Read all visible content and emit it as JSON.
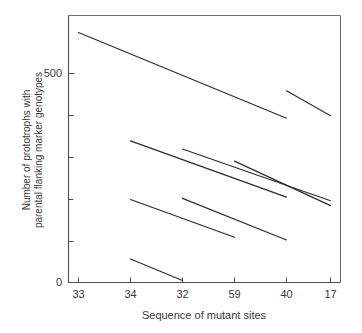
{
  "chart_data": {
    "type": "line",
    "title": "",
    "subtitle": "",
    "xlabel": "Sequence of mutant sites",
    "ylabel": "Number of prototrophs with parental flanking marker genotypes",
    "ylabel_line1": "Number of prototrophs with",
    "ylabel_line2": "parental flanking marker genotypes",
    "categories": [
      "33",
      "34",
      "32",
      "59",
      "40",
      "17"
    ],
    "xtick_labels": [
      "33",
      "34",
      "32",
      "59",
      "40",
      "17"
    ],
    "ytick_labels": [
      "500",
      "0"
    ],
    "ylim": [
      0,
      660
    ],
    "ytick_values": [
      0,
      100,
      200,
      300,
      400,
      500,
      600
    ],
    "ylabeled_ticks": [
      0,
      500
    ],
    "grid": false,
    "legend": false,
    "legend_position": "none",
    "axis_style": "box-frame",
    "series": [
      {
        "name": "segment-1",
        "from_category": "33",
        "to_category": "40",
        "x": [
          1,
          5
        ],
        "values": [
          618,
          406
        ]
      },
      {
        "name": "segment-2",
        "from_category": "40",
        "to_category": "17",
        "x": [
          5,
          6
        ],
        "values": [
          474,
          412
        ]
      },
      {
        "name": "segment-3",
        "from_category": "34",
        "to_category": "40",
        "x": [
          2,
          5
        ],
        "values": [
          350,
          211
        ]
      },
      {
        "name": "segment-4",
        "from_category": "32",
        "to_category": "17",
        "x": [
          3,
          6
        ],
        "values": [
          330,
          202
        ]
      },
      {
        "name": "segment-5",
        "from_category": "59",
        "to_category": "17",
        "x": [
          4,
          6
        ],
        "values": [
          300,
          190
        ]
      },
      {
        "name": "segment-6",
        "from_category": "34",
        "to_category": "59",
        "x": [
          2,
          4
        ],
        "values": [
          205,
          112
        ]
      },
      {
        "name": "segment-7",
        "from_category": "32",
        "to_category": "40",
        "x": [
          3,
          5
        ],
        "values": [
          208,
          105
        ]
      },
      {
        "name": "segment-8",
        "from_category": "34",
        "to_category": "32",
        "x": [
          2,
          3
        ],
        "values": [
          58,
          5
        ]
      }
    ]
  },
  "axes": {
    "x_title": "Sequence of mutant sites",
    "y_title_line1": "Number of prototrophs with",
    "y_title_line2": "parental flanking marker genotypes",
    "x_ticks": [
      "33",
      "34",
      "32",
      "59",
      "40",
      "17"
    ],
    "y_ticks": [
      "500",
      "0"
    ]
  },
  "colors": {
    "line": "#2b2b2b",
    "axis": "#4d4d4d",
    "frame": "#6b6b6b",
    "text": "#3a3a3a",
    "background": "#ffffff"
  }
}
